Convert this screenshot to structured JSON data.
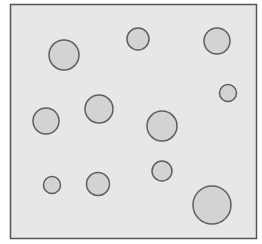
{
  "diagram": {
    "background": "#ffffff",
    "frame": {
      "x": 10.5,
      "y": 4.5,
      "width": 246,
      "height": 234,
      "fill": "#e7e7e7",
      "stroke": "#555555",
      "stroke_width": 1.5
    },
    "circle_style": {
      "fill": "#d3d3d3",
      "stroke": "#5f5f5f",
      "stroke_width": 1.5
    },
    "circles": [
      {
        "cx": 64,
        "cy": 55,
        "r": 15
      },
      {
        "cx": 138,
        "cy": 39,
        "r": 11
      },
      {
        "cx": 217,
        "cy": 41,
        "r": 13
      },
      {
        "cx": 228,
        "cy": 93,
        "r": 8.5
      },
      {
        "cx": 46,
        "cy": 121,
        "r": 13
      },
      {
        "cx": 99,
        "cy": 109,
        "r": 14
      },
      {
        "cx": 162,
        "cy": 126,
        "r": 15
      },
      {
        "cx": 52,
        "cy": 185,
        "r": 8.5
      },
      {
        "cx": 98,
        "cy": 184,
        "r": 11.5
      },
      {
        "cx": 162,
        "cy": 171,
        "r": 10
      },
      {
        "cx": 212,
        "cy": 205,
        "r": 19
      }
    ]
  }
}
